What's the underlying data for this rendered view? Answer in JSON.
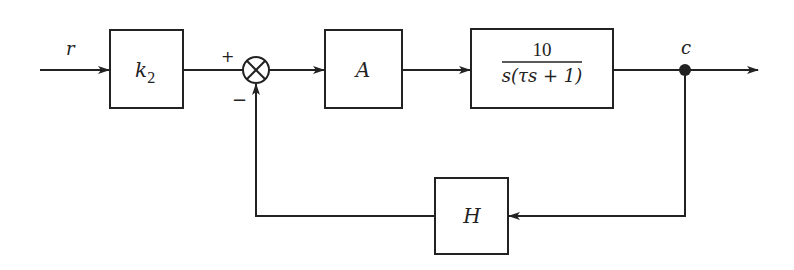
{
  "diagram": {
    "type": "block-diagram",
    "input_label": "r",
    "output_label": "c",
    "blocks": {
      "k2": {
        "label": "k",
        "subscript": "2"
      },
      "amplifier": {
        "label": "A"
      },
      "plant": {
        "numerator": "10",
        "denominator": "s(τs + 1)"
      },
      "feedback": {
        "label": "H"
      }
    },
    "summing_junction": {
      "plus_sign": "+",
      "minus_sign": "−"
    },
    "colors": {
      "line": "#222222",
      "background": "#ffffff"
    }
  }
}
